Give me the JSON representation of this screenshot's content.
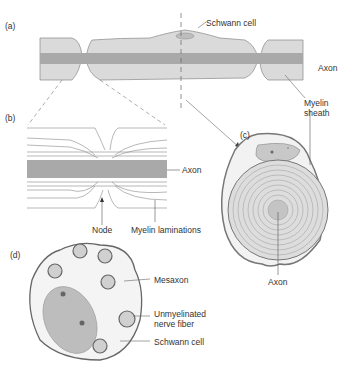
{
  "panels": {
    "a": {
      "tag": "(a)",
      "labels": {
        "schwann": "Schwann cell",
        "axon": "Axon",
        "myelin_line1": "Myelin",
        "myelin_line2": "sheath"
      }
    },
    "b": {
      "tag": "(b)",
      "labels": {
        "axon": "Axon",
        "node": "Node",
        "laminations": "Myelin laminations"
      }
    },
    "c": {
      "tag": "(c)",
      "labels": {
        "axon": "Axon"
      }
    },
    "d": {
      "tag": "(d)",
      "labels": {
        "mesaxon": "Mesaxon",
        "unmyelinated_line1": "Unmyelinated",
        "unmyelinated_line2": "nerve fiber",
        "schwann": "Schwann cell"
      }
    }
  },
  "colors": {
    "sheath": "#d9d9d9",
    "axon": "#a8a8a8",
    "outline": "#6e6e6e",
    "nucleus": "#bdbdbd",
    "dot": "#666666"
  }
}
